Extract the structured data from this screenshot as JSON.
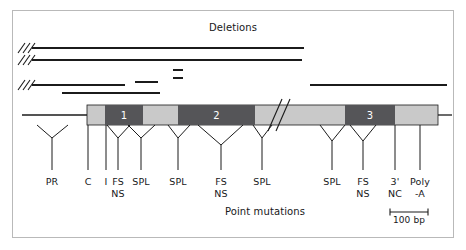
{
  "figure": {
    "top_title": "Deletions",
    "bottom_title": "Point mutations",
    "scale_label": "100 bp"
  },
  "gene": {
    "utr_color": "#c9c9c9",
    "exon_color": "#555558",
    "line_color": "#1b1b1b",
    "bar_x": 87,
    "bar_w": 351,
    "bar_y": 105,
    "bar_h": 20,
    "exons": [
      {
        "label": "1",
        "x": 105,
        "w": 38
      },
      {
        "label": "2",
        "x": 178,
        "w": 77
      },
      {
        "label": "3",
        "x": 345,
        "w": 50
      }
    ],
    "break_x": 268,
    "flank_left": {
      "x1": 22,
      "x2": 87
    },
    "flank_right": {
      "x1": 438,
      "x2": 452
    }
  },
  "deletions": [
    {
      "x1": 32,
      "x2": 304,
      "y": 48,
      "hash": true
    },
    {
      "x1": 32,
      "x2": 302,
      "y": 60,
      "hash": true
    },
    {
      "x1": 173,
      "x2": 183,
      "y": 70,
      "hash": false
    },
    {
      "x1": 173,
      "x2": 183,
      "y": 78,
      "hash": false
    },
    {
      "x1": 32,
      "x2": 125,
      "y": 85,
      "hash": true
    },
    {
      "x1": 135,
      "x2": 158,
      "y": 82,
      "hash": false
    },
    {
      "x1": 310,
      "x2": 447,
      "y": 85,
      "hash": false
    },
    {
      "x1": 62,
      "x2": 160,
      "y": 93,
      "hash": false
    }
  ],
  "mutations": [
    {
      "label": "PR",
      "sub": "",
      "stem_x": 52,
      "apex_x": 52,
      "left_x": 37,
      "right_x": 68,
      "apex_y": 138,
      "stem_bottom": 170
    },
    {
      "label": "C",
      "sub": "",
      "stem_x": 88,
      "apex_x": 88,
      "left_x": 88,
      "right_x": 88,
      "apex_y": 125,
      "stem_bottom": 170
    },
    {
      "label": "I",
      "sub": "",
      "stem_x": 106,
      "apex_x": 106,
      "left_x": 106,
      "right_x": 106,
      "apex_y": 125,
      "stem_bottom": 170
    },
    {
      "label": "FS",
      "sub": "NS",
      "stem_x": 118,
      "apex_x": 118,
      "left_x": 107,
      "right_x": 130,
      "apex_y": 138,
      "stem_bottom": 170
    },
    {
      "label": "SPL",
      "sub": "",
      "stem_x": 141,
      "apex_x": 141,
      "left_x": 128,
      "right_x": 155,
      "apex_y": 138,
      "stem_bottom": 170
    },
    {
      "label": "SPL",
      "sub": "",
      "stem_x": 178,
      "apex_x": 178,
      "left_x": 168,
      "right_x": 190,
      "apex_y": 138,
      "stem_bottom": 170
    },
    {
      "label": "FS",
      "sub": "NS",
      "stem_x": 221,
      "apex_x": 221,
      "left_x": 198,
      "right_x": 243,
      "apex_y": 145,
      "stem_bottom": 170
    },
    {
      "label": "SPL",
      "sub": "",
      "stem_x": 262,
      "apex_x": 262,
      "left_x": 253,
      "right_x": 272,
      "apex_y": 138,
      "stem_bottom": 170
    },
    {
      "label": "SPL",
      "sub": "",
      "stem_x": 332,
      "apex_x": 332,
      "left_x": 320,
      "right_x": 345,
      "apex_y": 141,
      "stem_bottom": 170
    },
    {
      "label": "FS",
      "sub": "NS",
      "stem_x": 363,
      "apex_x": 363,
      "left_x": 350,
      "right_x": 376,
      "apex_y": 141,
      "stem_bottom": 170
    },
    {
      "label": "3'",
      "sub": "NC",
      "stem_x": 395,
      "apex_x": 395,
      "left_x": 395,
      "right_x": 395,
      "apex_y": 125,
      "stem_bottom": 170
    },
    {
      "label": "Poly",
      "sub": "-A",
      "stem_x": 420,
      "apex_x": 420,
      "left_x": 420,
      "right_x": 420,
      "apex_y": 125,
      "stem_bottom": 170
    }
  ],
  "scale_bar": {
    "x1": 390,
    "x2": 428,
    "y": 212
  }
}
